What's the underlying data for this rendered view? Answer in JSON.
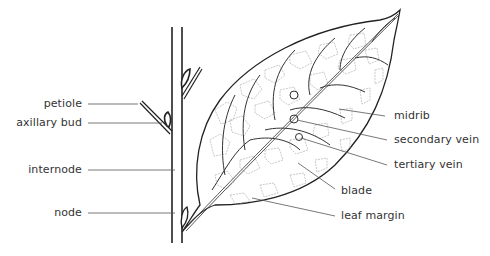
{
  "labels_left": [
    {
      "id": "petiole",
      "text": "petiole"
    },
    {
      "id": "axillary-bud",
      "text": "axillary bud"
    },
    {
      "id": "internode",
      "text": "internode"
    },
    {
      "id": "node",
      "text": "node"
    }
  ],
  "labels_right": [
    {
      "id": "midrib",
      "text": "midrib"
    },
    {
      "id": "secondary-vein",
      "text": "secondary vein"
    },
    {
      "id": "tertiary-vein",
      "text": "tertiary vein"
    },
    {
      "id": "blade",
      "text": "blade"
    },
    {
      "id": "leaf-margin",
      "text": "leaf margin"
    }
  ],
  "colors": {
    "line": "#222222",
    "vein_fine": "#9a9a9a",
    "leader": "#555555",
    "text": "#333333"
  }
}
